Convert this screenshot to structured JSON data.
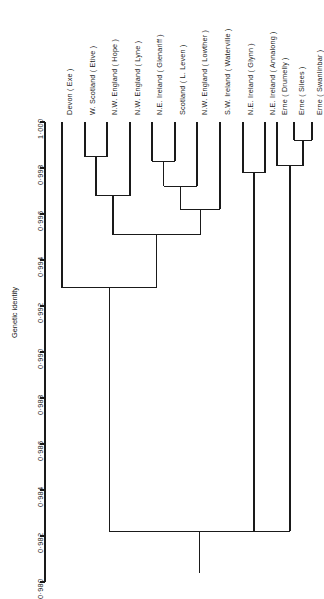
{
  "figure": {
    "type": "dendrogram",
    "axis_title": "Genetic identity",
    "axis_ticks": [
      "1·000",
      "0·998",
      "0·996",
      "0·994",
      "0·992",
      "0·990",
      "0·988",
      "0·986",
      "0·984",
      "0·982",
      "0·980"
    ],
    "line_color": "#1a1a1a"
  },
  "chart_data": {
    "type": "dendrogram",
    "title": "",
    "xlabel": "",
    "ylabel": "Genetic identity",
    "ylim": [
      0.98,
      1.0
    ],
    "ytick_values": [
      1.0,
      0.998,
      0.996,
      0.994,
      0.992,
      0.99,
      0.988,
      0.986,
      0.984,
      0.982,
      0.98
    ],
    "ytick_labels": [
      "1·000",
      "0·998",
      "0·996",
      "0·994",
      "0·992",
      "0·990",
      "0·988",
      "0·986",
      "0·984",
      "0·982",
      "0·980"
    ],
    "grid": false,
    "legend": false,
    "orientation": "leaves-at-top",
    "leaf_labels": [
      "Devon ( Exe )",
      "W. Scotland ( Etive )",
      "N.W. England ( Hope )",
      "N.W. England ( Lyne )",
      "N.E. Ireland ( Glenariff )",
      "Scotland ( L. Leven )",
      "N.W. England ( Lowther )",
      "S.W. Ireland ( Waterville )",
      "N.E. Ireland ( Glynn )",
      "N.E. Ireland ( Annalong )",
      "Erne ( Drumelly )",
      "Erne ( Silees )",
      "Erne ( Swanlinbar )"
    ],
    "merges": [
      {
        "name": "Etive + Hope",
        "children": [
          "W. Scotland ( Etive )",
          "N.W. England ( Hope )"
        ],
        "genetic_identity": 0.9985
      },
      {
        "name": "Glenariff + L. Leven",
        "children": [
          "N.E. Ireland ( Glenariff )",
          "Scotland ( L. Leven )"
        ],
        "genetic_identity": 0.9983
      },
      {
        "name": "Silees + Swanlinbar",
        "children": [
          "Erne ( Silees )",
          "Erne ( Swanlinbar )"
        ],
        "genetic_identity": 0.9992
      },
      {
        "name": "(Glenariff,L.Leven) + Lowther",
        "children": [
          "Glenariff + L. Leven",
          "N.W. England ( Lowther )"
        ],
        "genetic_identity": 0.9972
      },
      {
        "name": "Drumelly + (Silees,Swanlinbar)",
        "children": [
          "Erne ( Drumelly )",
          "Silees + Swanlinbar"
        ],
        "genetic_identity": 0.9981
      },
      {
        "name": "(Etive,Hope) + Lyne",
        "children": [
          "Etive + Hope",
          "N.W. England ( Lyne )"
        ],
        "genetic_identity": 0.9968
      },
      {
        "name": "Glynn + Annalong",
        "children": [
          "N.E. Ireland ( Glynn )",
          "N.E. Ireland ( Annalong )"
        ],
        "genetic_identity": 0.9978
      },
      {
        "name": "((Glenariff,L.Leven),Lowther) + Waterville",
        "children": [
          "(Glenariff,L.Leven) + Lowther",
          "S.W. Ireland ( Waterville )"
        ],
        "genetic_identity": 0.9962
      },
      {
        "name": "Britain-Ireland core",
        "children": [
          "(Etive,Hope) + Lyne",
          "((Glenariff,L.Leven),Lowther) + Waterville"
        ],
        "genetic_identity": 0.9951
      },
      {
        "name": "Devon + core",
        "children": [
          "Devon ( Exe )",
          "Britain-Ireland core"
        ],
        "genetic_identity": 0.9928
      },
      {
        "name": "Root",
        "children": [
          "Devon + core",
          "Glynn + Annalong",
          "Drumelly + (Silees,Swanlinbar)"
        ],
        "genetic_identity": 0.9822
      }
    ]
  },
  "leaves": [
    {
      "label": "Devon ( Exe )",
      "x": 62
    },
    {
      "label": "W. Scotland ( Etive )",
      "x": 85
    },
    {
      "label": "N.W. England ( Hope )",
      "x": 107
    },
    {
      "label": "N.W. England ( Lyne )",
      "x": 130
    },
    {
      "label": "N.E. Ireland ( Glenariff )",
      "x": 152
    },
    {
      "label": "Scotland ( L. Leven )",
      "x": 175
    },
    {
      "label": "N.W. England ( Lowther )",
      "x": 197
    },
    {
      "label": "S.W. Ireland ( Waterville )",
      "x": 220
    },
    {
      "label": "N.E. Ireland ( Glynn )",
      "x": 243
    },
    {
      "label": "N.E. Ireland ( Annalong )",
      "x": 265
    },
    {
      "label": "Erne ( Drumelly )",
      "x": 277
    },
    {
      "label": "Erne ( Silees )",
      "x": 294
    },
    {
      "label": "Erne ( Swanlinbar )",
      "x": 312
    }
  ]
}
